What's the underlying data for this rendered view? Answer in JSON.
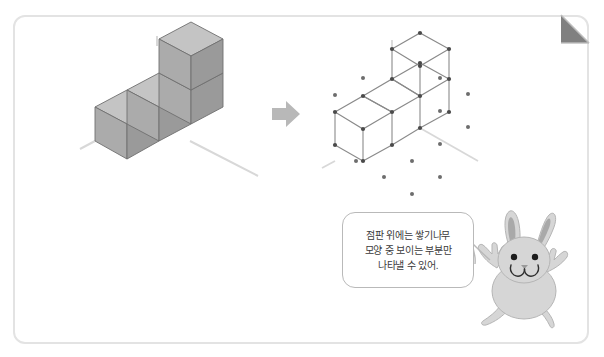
{
  "page": {
    "background_color": "#ffffff",
    "border_color": "#e3e3e3",
    "fold_color": "#808080",
    "fold_edge_color": "#bdbdbd"
  },
  "colors": {
    "cube_top": "#c4c4c4",
    "cube_left": "#ababab",
    "cube_right": "#9a9a9a",
    "cube_outline": "#6f6f6f",
    "ground_line": "#d8d8d8",
    "arrow": "#b8b8b8",
    "dot": "#6d6d6d",
    "wire": "#8a8a8a",
    "bubble_border": "#b9b9b9",
    "bubble_text": "#3b3b3b",
    "rabbit_body": "#d6d6d6",
    "rabbit_inner_ear": "#a9a9a9",
    "rabbit_outline": "#b5b5b5",
    "rabbit_eye": "#1c1c1c"
  },
  "figures": {
    "solid_figure": {
      "name": "stacked-cubes-solid",
      "description": "isometric solid made of unit cubes",
      "bottom_row_count": 3,
      "stacked_count": 1,
      "total_cubes": 4
    },
    "arrow": {
      "name": "right-arrow",
      "direction": "right",
      "glyph": "➡"
    },
    "dot_grid_figure": {
      "name": "stacked-cubes-on-dot-grid",
      "description": "same solid drawn as wireframe on isometric dot paper",
      "bottom_row_count": 3,
      "stacked_count": 1,
      "total_cubes": 4
    }
  },
  "bubble": {
    "lines": [
      "점판 위에는 쌓기나무",
      "모양 중 보이는 부분만",
      "나타낼 수 있어."
    ]
  },
  "character": {
    "name": "rabbit-character",
    "pose": "waving-both-arms"
  }
}
